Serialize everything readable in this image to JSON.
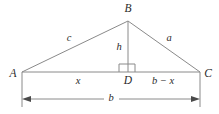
{
  "figure": {
    "kind": "geometry-diagram",
    "shape": "triangle-with-altitude",
    "background_color": "#ffffff",
    "line_color": "#8a8a8a",
    "text_color": "#2b2b2b"
  },
  "vertices": [
    {
      "id": "A",
      "label": "A",
      "x": 22,
      "y": 72,
      "label_x": 13,
      "label_y": 74
    },
    {
      "id": "B",
      "label": "B",
      "x": 128,
      "y": 21,
      "label_x": 128,
      "label_y": 9
    },
    {
      "id": "C",
      "label": "C",
      "x": 200,
      "y": 72,
      "label_x": 208,
      "label_y": 74
    },
    {
      "id": "D",
      "label": "D",
      "x": 128,
      "y": 72,
      "label_x": 128,
      "label_y": 81
    }
  ],
  "side_labels": [
    {
      "id": "c",
      "label": "c",
      "x": 69,
      "y": 38,
      "describes": "side A to B"
    },
    {
      "id": "a",
      "label": "a",
      "x": 169,
      "y": 38,
      "describes": "side B to C"
    },
    {
      "id": "h",
      "label": "h",
      "x": 119,
      "y": 47,
      "describes": "altitude B to D"
    },
    {
      "id": "x",
      "label": "x",
      "x": 78,
      "y": 81,
      "describes": "segment A to D"
    },
    {
      "id": "b_minus_x",
      "label": "b − x",
      "x": 163,
      "y": 81,
      "describes": "segment D to C"
    },
    {
      "id": "b",
      "label": "b",
      "x": 111,
      "y": 98,
      "describes": "full base A to C"
    }
  ],
  "markers": {
    "right_angle": {
      "present": true,
      "at_vertex": "D",
      "size": 8
    },
    "dimension_arrow": {
      "from_x": 22,
      "to_x": 200,
      "y": 99,
      "label": "b"
    }
  }
}
